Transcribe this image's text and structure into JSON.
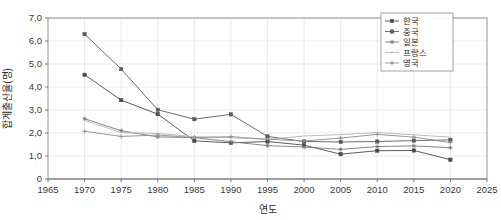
{
  "chart_data": {
    "type": "line",
    "title": "",
    "xlabel": "연도",
    "ylabel": "합계출산율(명)",
    "xlim": [
      1965,
      2025
    ],
    "ylim": [
      0,
      7
    ],
    "grid": true,
    "legend_position": "top-right",
    "x": [
      1970,
      1975,
      1980,
      1985,
      1990,
      1995,
      2000,
      2005,
      2010,
      2015,
      2020
    ],
    "xticks": [
      "1965",
      "1970",
      "1975",
      "1980",
      "1985",
      "1990",
      "1995",
      "2000",
      "2005",
      "2010",
      "2015",
      "2020",
      "2025"
    ],
    "yticks": [
      "0",
      "1,0",
      "2,0",
      "3,0",
      "4,0",
      "5,0",
      "6,0",
      "7,0"
    ],
    "series": [
      {
        "name": "한국",
        "marker": "square",
        "color": "#4a4a4a",
        "values": [
          4.53,
          3.43,
          2.82,
          1.66,
          1.57,
          1.63,
          1.47,
          1.08,
          1.23,
          1.24,
          0.84
        ]
      },
      {
        "name": "중국",
        "marker": "square",
        "color": "#5a5a5a",
        "values": [
          6.3,
          4.78,
          3.01,
          2.6,
          2.81,
          1.85,
          1.63,
          1.61,
          1.63,
          1.67,
          1.7
        ]
      },
      {
        "name": "일본",
        "marker": "star",
        "color": "#787878",
        "values": [
          2.62,
          2.1,
          1.83,
          1.8,
          1.62,
          1.45,
          1.39,
          1.29,
          1.41,
          1.44,
          1.36
        ]
      },
      {
        "name": "프랑스",
        "marker": "none",
        "color": "#b4b4b4",
        "values": [
          2.55,
          2.02,
          1.98,
          1.84,
          1.8,
          1.72,
          1.87,
          1.93,
          2.02,
          1.92,
          1.82
        ]
      },
      {
        "name": "영국",
        "marker": "plus",
        "color": "#8c8c8c",
        "values": [
          2.08,
          1.85,
          1.91,
          1.8,
          1.84,
          1.73,
          1.65,
          1.78,
          1.94,
          1.82,
          1.58
        ]
      }
    ]
  },
  "axes": {
    "x_title": "연도",
    "y_title": "합계출산율(명)"
  },
  "legend": {
    "entries": [
      {
        "label": "한국"
      },
      {
        "label": "중국"
      },
      {
        "label": "일본"
      },
      {
        "label": "프랑스"
      },
      {
        "label": "영국"
      }
    ]
  }
}
